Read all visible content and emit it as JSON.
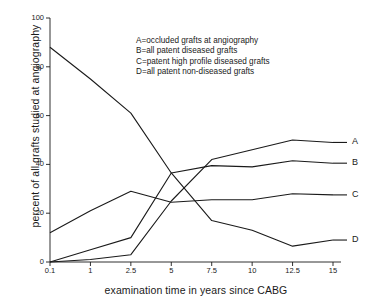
{
  "chart_data": {
    "type": "line",
    "title": "",
    "xlabel": "examination time in years since CABG",
    "ylabel": "percent of all grafts studied at angiography",
    "x": [
      0.1,
      1,
      2.5,
      5,
      7.5,
      10,
      12.5,
      15
    ],
    "xtick_labels": [
      "0.1",
      "1",
      "2.5",
      "5",
      "7.5",
      "10",
      "12.5",
      "15"
    ],
    "ytick_labels": [
      "0",
      "20",
      "40",
      "60",
      "80",
      "100"
    ],
    "ytick_values": [
      0,
      20,
      40,
      60,
      80,
      100
    ],
    "ylim": [
      0,
      100
    ],
    "x_scale": "categorical-evenly-spaced",
    "grid": false,
    "legend_position": "upper-center-inside",
    "series": [
      {
        "name": "A",
        "label": "A=occluded grafts at angiography",
        "values": [
          0,
          1,
          3,
          25,
          42,
          46,
          50,
          49
        ],
        "end_label": "A",
        "color": "#1a1a1a"
      },
      {
        "name": "B",
        "label": "B=all patent diseased grafts",
        "values": [
          0,
          5,
          10,
          36.5,
          39.5,
          39,
          41.5,
          40.5
        ],
        "end_label": "B",
        "color": "#1a1a1a"
      },
      {
        "name": "C",
        "label": "C=patent high profile diseased grafts",
        "values": [
          12,
          21,
          29,
          24.5,
          25.5,
          25.5,
          28,
          27.5
        ],
        "end_label": "C",
        "color": "#1a1a1a"
      },
      {
        "name": "D",
        "label": "D=all patent non-diseased grafts",
        "values": [
          88,
          75,
          61,
          36.5,
          17,
          13,
          6.5,
          9
        ],
        "end_label": "D",
        "color": "#1a1a1a"
      }
    ],
    "legend_lines": [
      "A=occluded grafts at angiography",
      "B=all patent diseased grafts",
      "C=patent high profile diseased grafts",
      "D=all patent non-diseased grafts"
    ]
  }
}
